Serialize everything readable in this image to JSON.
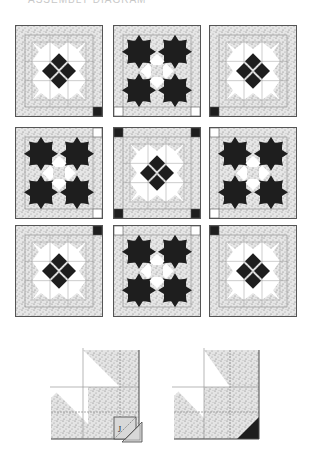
{
  "caption": "ASSEMBLY DIAGRAM",
  "colors": {
    "dark": "#1e1e1e",
    "print_bg": "#e6e6e6",
    "print_dot": "#8a8a8a",
    "line": "#555555",
    "white": "#ffffff",
    "grid_line": "#9a9a9a"
  },
  "quilt": {
    "rows": 3,
    "cols": 3,
    "blocks": [
      {
        "row": 0,
        "col": 0,
        "type": "diamond-block",
        "corners": {
          "br": "dark"
        }
      },
      {
        "row": 0,
        "col": 1,
        "type": "star-block",
        "corners": {
          "bl": "white",
          "br": "white"
        }
      },
      {
        "row": 0,
        "col": 2,
        "type": "diamond-block",
        "corners": {
          "bl": "dark"
        }
      },
      {
        "row": 1,
        "col": 0,
        "type": "star-block",
        "corners": {
          "tr": "white",
          "br": "white"
        }
      },
      {
        "row": 1,
        "col": 1,
        "type": "diamond-block",
        "corners": {
          "tl": "dark",
          "tr": "dark",
          "bl": "dark",
          "br": "dark"
        }
      },
      {
        "row": 1,
        "col": 2,
        "type": "star-block",
        "corners": {
          "tl": "white",
          "bl": "white"
        }
      },
      {
        "row": 2,
        "col": 0,
        "type": "diamond-block",
        "corners": {
          "tr": "dark"
        }
      },
      {
        "row": 2,
        "col": 1,
        "type": "star-block",
        "corners": {
          "tl": "white",
          "tr": "white"
        }
      },
      {
        "row": 2,
        "col": 2,
        "type": "diamond-block",
        "corners": {
          "tl": "dark"
        }
      }
    ]
  },
  "detail_diagrams": [
    {
      "name": "corner-before",
      "label": "J",
      "description": "Square J placed on corner with stitching diagonal; trimmed triangle shown"
    },
    {
      "name": "corner-after",
      "label": "",
      "description": "Corner pressed to dark triangle"
    }
  ]
}
